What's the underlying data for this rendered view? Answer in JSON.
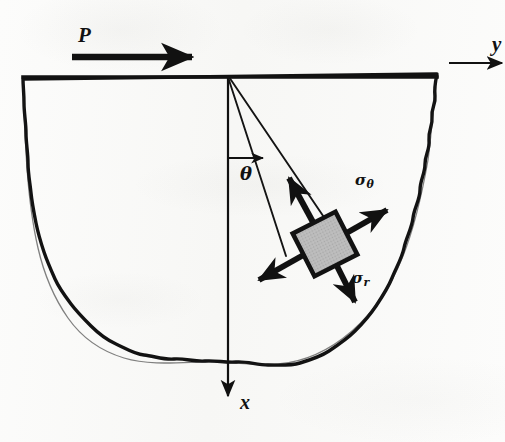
{
  "figure": {
    "type": "engineering-diagram",
    "background_color": "#fbfbfa",
    "ink_color": "#111111",
    "element_fill_color": "#b9b9b9"
  },
  "labels": {
    "load": "P",
    "axis_y": "y",
    "axis_x": "x",
    "angle": "θ",
    "stress_hoop_symbol": "σ",
    "stress_hoop_subscript": "θ",
    "stress_radial_symbol": "σ",
    "stress_radial_subscript": "r"
  },
  "geometry": {
    "origin": {
      "x": 228,
      "y": 77
    },
    "surface_line": {
      "x1": 23,
      "y1": 77,
      "x2": 437,
      "y2": 77
    },
    "load_arrow": {
      "x1": 72,
      "y1": 57,
      "x2": 200,
      "y2": 57,
      "thickness": 6
    },
    "y_axis_arrow": {
      "x1": 448,
      "y1": 62,
      "x2": 504,
      "y2": 62
    },
    "x_axis_arrow": {
      "x1": 228,
      "y1": 77,
      "x2": 228,
      "y2": 400
    },
    "theta_arc_arrow": {
      "cx": 228,
      "cy": 77,
      "radius": 88,
      "from_deg": 0,
      "to_deg": 22
    },
    "wedge_ray_left_deg": 18,
    "wedge_ray_right_deg": 27,
    "element": {
      "cx": 325,
      "cy": 244,
      "size": 47,
      "rotation_deg": -27
    },
    "stress_arrows": [
      {
        "name": "sigma-theta-positive",
        "angle_deg": -38,
        "length": 62
      },
      {
        "name": "sigma-theta-negative",
        "angle_deg": 142,
        "length": 62
      },
      {
        "name": "sigma-r-positive",
        "angle_deg": 62,
        "length": 54
      },
      {
        "name": "sigma-r-negative",
        "angle_deg": -118,
        "length": 62
      }
    ]
  }
}
